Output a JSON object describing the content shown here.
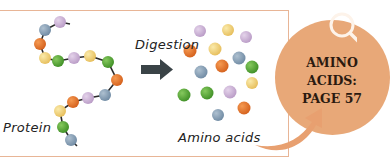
{
  "labels": {
    "protein": "Protein",
    "digestion": "Digestion",
    "amino_acids": "Amino acids"
  },
  "callout": {
    "lines": [
      "AMINO",
      "ACIDS:",
      "PAGE 57"
    ],
    "icon": "magnifier-icon"
  },
  "colors": {
    "frame_border": "#e8b596",
    "callout_fill": "#e8a878",
    "arrow": "#3a4347",
    "lilac": "#cdb2d6",
    "blue": "#8aa2b8",
    "orange": "#e8732a",
    "yellow": "#f2d27a",
    "green": "#5aaa3a"
  },
  "protein_chain": [
    "lilac",
    "blue",
    "orange",
    "yellow",
    "green",
    "lilac",
    "yellow",
    "green",
    "orange",
    "blue",
    "lilac",
    "orange",
    "yellow",
    "green",
    "blue"
  ],
  "free_amino_acids": [
    "lilac",
    "yellow",
    "lilac",
    "orange",
    "yellow",
    "blue",
    "orange",
    "green",
    "blue",
    "yellow",
    "green",
    "green",
    "lilac",
    "orange",
    "blue"
  ]
}
